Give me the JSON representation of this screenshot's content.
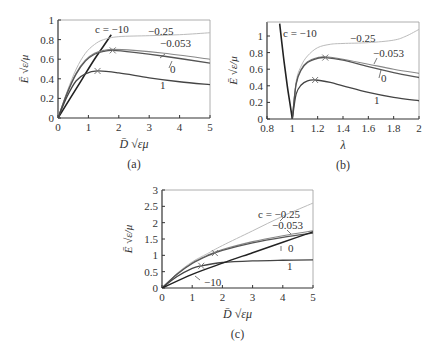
{
  "figure": {
    "panels": [
      {
        "id": "a",
        "caption": "(a)",
        "xlabel": "D̄ √εμ",
        "ylabel": "Ē √ε/μ"
      },
      {
        "id": "b",
        "caption": "(b)",
        "xlabel": "λ",
        "ylabel": "Ē √ε/μ"
      },
      {
        "id": "c",
        "caption": "(c)",
        "xlabel": "D̄ √εμ",
        "ylabel": "Ē √ε/μ"
      }
    ]
  },
  "colors": {
    "c_-10": "#222222",
    "c_-0.25": "#bbbbbb",
    "c_-0.053": "#888888",
    "c_0": "#555555",
    "c_1": "#444444",
    "axis": "#333333"
  },
  "chart_data": [
    {
      "type": "line",
      "panel": "a",
      "caption": "(a)",
      "xlabel": "D̄ √εμ",
      "ylabel": "Ē √ε/μ",
      "xlim": [
        0,
        5
      ],
      "ylim": [
        0,
        1
      ],
      "xticks": [
        0,
        1,
        2,
        3,
        4,
        5
      ],
      "yticks": [
        0,
        0.2,
        0.4,
        0.6,
        0.8,
        1
      ],
      "grid": false,
      "series": [
        {
          "name": "c = −10",
          "label": "c = −10",
          "x": [
            0,
            0.4,
            0.8,
            1.2,
            1.6,
            1.75
          ],
          "y": [
            0,
            0.2,
            0.4,
            0.6,
            0.78,
            0.85
          ]
        },
        {
          "name": "−0.25",
          "label": "−0.25",
          "x": [
            0,
            0.3,
            0.6,
            0.9,
            1.2,
            1.5,
            2,
            3,
            4,
            5
          ],
          "y": [
            0,
            0.27,
            0.5,
            0.66,
            0.75,
            0.8,
            0.83,
            0.84,
            0.85,
            0.87
          ]
        },
        {
          "name": "−0.053",
          "label": "−0.053",
          "x": [
            0,
            0.3,
            0.6,
            0.9,
            1.2,
            1.5,
            1.8,
            2.5,
            3.5,
            5
          ],
          "y": [
            0,
            0.26,
            0.46,
            0.59,
            0.66,
            0.69,
            0.7,
            0.69,
            0.66,
            0.6
          ]
        },
        {
          "name": "0",
          "label": "0",
          "x": [
            0,
            0.3,
            0.6,
            0.9,
            1.2,
            1.5,
            1.8,
            2.5,
            3.5,
            5
          ],
          "y": [
            0,
            0.25,
            0.45,
            0.58,
            0.65,
            0.68,
            0.69,
            0.67,
            0.63,
            0.56
          ]
        },
        {
          "name": "1",
          "label": "1",
          "x": [
            0,
            0.3,
            0.6,
            0.9,
            1.3,
            2,
            3,
            4,
            5
          ],
          "y": [
            0,
            0.22,
            0.38,
            0.45,
            0.48,
            0.46,
            0.41,
            0.37,
            0.34
          ]
        }
      ],
      "markers": [
        {
          "series": "−0.053/0",
          "x": 1.8,
          "y": 0.69,
          "symbol": "×"
        },
        {
          "series": "1",
          "x": 1.3,
          "y": 0.48,
          "symbol": "×"
        }
      ]
    },
    {
      "type": "line",
      "panel": "b",
      "caption": "(b)",
      "xlabel": "λ",
      "ylabel": "Ē √ε/μ",
      "xlim": [
        0.8,
        2
      ],
      "ylim": [
        0,
        1.15
      ],
      "xticks": [
        0.8,
        1,
        1.2,
        1.4,
        1.6,
        1.8,
        2
      ],
      "yticks": [
        0,
        0.2,
        0.4,
        0.6,
        0.8,
        1
      ],
      "grid": false,
      "series": [
        {
          "name": "c = −10",
          "label": "c = −10",
          "x": [
            0.9,
            0.93,
            0.96,
            0.98,
            1.0
          ],
          "y": [
            1.15,
            0.75,
            0.4,
            0.2,
            0
          ]
        },
        {
          "name": "−0.25",
          "label": "−0.25",
          "x": [
            1.0,
            1.03,
            1.07,
            1.12,
            1.2,
            1.3,
            1.4,
            1.6,
            1.8,
            1.9,
            2.0
          ],
          "y": [
            0,
            0.45,
            0.64,
            0.76,
            0.86,
            0.9,
            0.91,
            0.92,
            0.95,
            1.0,
            1.08
          ]
        },
        {
          "name": "−0.053",
          "label": "−0.053",
          "x": [
            1.0,
            1.03,
            1.07,
            1.12,
            1.2,
            1.26,
            1.4,
            1.6,
            1.8,
            2.0
          ],
          "y": [
            0,
            0.43,
            0.6,
            0.69,
            0.74,
            0.75,
            0.72,
            0.66,
            0.6,
            0.55
          ]
        },
        {
          "name": "0",
          "label": "0",
          "x": [
            1.0,
            1.03,
            1.07,
            1.12,
            1.2,
            1.26,
            1.4,
            1.6,
            1.8,
            2.0
          ],
          "y": [
            0,
            0.42,
            0.59,
            0.68,
            0.73,
            0.74,
            0.71,
            0.63,
            0.56,
            0.5
          ]
        },
        {
          "name": "1",
          "label": "1",
          "x": [
            1.0,
            1.03,
            1.07,
            1.12,
            1.18,
            1.3,
            1.4,
            1.6,
            1.8,
            2.0
          ],
          "y": [
            0,
            0.3,
            0.41,
            0.46,
            0.47,
            0.44,
            0.4,
            0.32,
            0.26,
            0.22
          ]
        }
      ],
      "markers": [
        {
          "series": "−0.053/0",
          "x": 1.26,
          "y": 0.74,
          "symbol": "×"
        },
        {
          "series": "1",
          "x": 1.18,
          "y": 0.47,
          "symbol": "×"
        }
      ]
    },
    {
      "type": "line",
      "panel": "c",
      "caption": "(c)",
      "xlabel": "D̄ √εμ",
      "ylabel": "Ē √ε/μ",
      "xlim": [
        0,
        5
      ],
      "ylim": [
        0,
        3
      ],
      "xticks": [
        0,
        1,
        2,
        3,
        4,
        5
      ],
      "yticks": [
        0,
        0.5,
        1,
        1.5,
        2,
        2.5,
        3
      ],
      "grid": false,
      "series": [
        {
          "name": "c = −0.25",
          "label": "c = −0.25",
          "x": [
            0,
            0.5,
            1,
            1.5,
            2,
            3,
            4,
            5
          ],
          "y": [
            0,
            0.45,
            0.8,
            1.05,
            1.3,
            1.75,
            2.2,
            2.6
          ]
        },
        {
          "name": "−0.053",
          "label": "−0.053",
          "x": [
            0,
            0.5,
            1,
            1.5,
            2,
            3,
            4,
            5
          ],
          "y": [
            0,
            0.43,
            0.77,
            1.0,
            1.18,
            1.42,
            1.6,
            1.75
          ]
        },
        {
          "name": "0",
          "label": "0",
          "x": [
            0,
            0.5,
            1,
            1.5,
            2,
            3,
            4,
            5
          ],
          "y": [
            0,
            0.42,
            0.75,
            0.98,
            1.15,
            1.38,
            1.55,
            1.68
          ]
        },
        {
          "name": "1",
          "label": "1",
          "x": [
            0,
            0.5,
            1,
            1.3,
            2,
            3,
            4,
            5
          ],
          "y": [
            0,
            0.35,
            0.6,
            0.68,
            0.78,
            0.83,
            0.85,
            0.86
          ]
        },
        {
          "name": "−10",
          "label": "−10",
          "x": [
            0,
            1,
            2,
            3,
            4,
            5
          ],
          "y": [
            0,
            0.42,
            0.76,
            1.08,
            1.4,
            1.72
          ]
        }
      ],
      "markers": [
        {
          "series": "−0.053/0",
          "x": 1.75,
          "y": 1.07,
          "symbol": "×"
        },
        {
          "series": "1",
          "x": 1.3,
          "y": 0.68,
          "symbol": "×"
        }
      ]
    }
  ]
}
